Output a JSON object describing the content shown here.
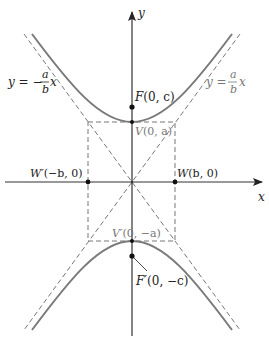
{
  "diagram": {
    "type": "hyperbola-vertical-transverse-axis",
    "axes": {
      "x_label": "x",
      "y_label": "y"
    },
    "asymptotes": {
      "negative": {
        "lhs": "y = −",
        "num": "a",
        "den": "b",
        "var": "x"
      },
      "positive": {
        "lhs": "y = ",
        "num": "a",
        "den": "b",
        "var": "x"
      }
    },
    "points": {
      "focus_top": {
        "name": "F",
        "coords": "(0, c)"
      },
      "focus_bottom": {
        "name": "F′",
        "coords": "(0, −c)"
      },
      "vertex_top": {
        "name": "V",
        "coords": "(0, a)"
      },
      "vertex_bottom": {
        "name": "V′",
        "coords": "(0, −a)"
      },
      "covertex_left": {
        "name": "W′",
        "coords": "(−b, 0)"
      },
      "covertex_right": {
        "name": "W",
        "coords": "(b, 0)"
      }
    },
    "colors": {
      "curve": "#7a7a7a",
      "axis": "#333333",
      "dashed": "#777777",
      "point": "#111111",
      "gray_label": "#777777"
    }
  }
}
